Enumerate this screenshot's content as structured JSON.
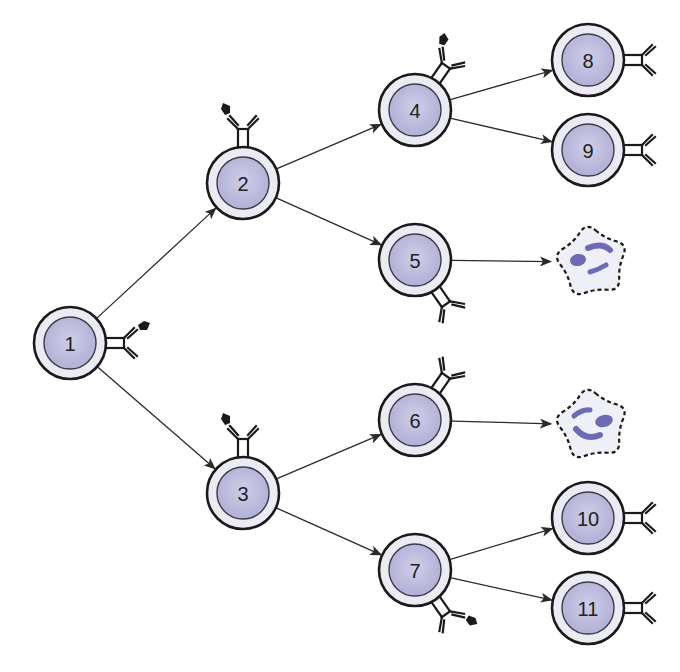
{
  "diagram": {
    "type": "B-cell clonal expansion / differentiation tree",
    "colors": {
      "background": "#ffffff",
      "cell_outline": "#1a1a1a",
      "cell_ring": "#ecebf4",
      "nucleus_fill": "#b8b7da",
      "nucleus_outline": "#3a3a4a",
      "plasma_cell_fill": "#efeff7",
      "plasma_cell_nuclear_fragments": "#6e6bb5",
      "arrow": "#2a2a2a",
      "antigen": "#1a1a1a"
    },
    "cells": [
      {
        "id": "1",
        "label": "1",
        "x": 70,
        "y": 343,
        "receptor_angle": 0,
        "antigen_bound": true
      },
      {
        "id": "2",
        "label": "2",
        "x": 243,
        "y": 183,
        "receptor_angle": -90,
        "antigen_bound": true
      },
      {
        "id": "3",
        "label": "3",
        "x": 243,
        "y": 493,
        "receptor_angle": -90,
        "antigen_bound": true
      },
      {
        "id": "4",
        "label": "4",
        "x": 415,
        "y": 110,
        "receptor_angle": -55,
        "antigen_bound": true
      },
      {
        "id": "5",
        "label": "5",
        "x": 415,
        "y": 260,
        "receptor_angle": 55,
        "antigen_bound": false
      },
      {
        "id": "6",
        "label": "6",
        "x": 415,
        "y": 420,
        "receptor_angle": -55,
        "antigen_bound": false
      },
      {
        "id": "7",
        "label": "7",
        "x": 415,
        "y": 570,
        "receptor_angle": 55,
        "antigen_bound": true
      },
      {
        "id": "8",
        "label": "8",
        "x": 588,
        "y": 60,
        "receptor_angle": 0,
        "antigen_bound": false
      },
      {
        "id": "9",
        "label": "9",
        "x": 588,
        "y": 150,
        "receptor_angle": 0,
        "antigen_bound": false
      },
      {
        "id": "10",
        "label": "10",
        "x": 588,
        "y": 518,
        "receptor_angle": 0,
        "antigen_bound": false
      },
      {
        "id": "11",
        "label": "11",
        "x": 588,
        "y": 608,
        "receptor_angle": 0,
        "antigen_bound": false
      }
    ],
    "plasma_cells": [
      {
        "id": "plasma-a",
        "x": 592,
        "y": 262,
        "from": "5"
      },
      {
        "id": "plasma-b",
        "x": 592,
        "y": 425,
        "from": "6"
      }
    ],
    "edges": [
      {
        "from": "1",
        "to": "2"
      },
      {
        "from": "1",
        "to": "3"
      },
      {
        "from": "2",
        "to": "4"
      },
      {
        "from": "2",
        "to": "5"
      },
      {
        "from": "3",
        "to": "6"
      },
      {
        "from": "3",
        "to": "7"
      },
      {
        "from": "4",
        "to": "8"
      },
      {
        "from": "4",
        "to": "9"
      },
      {
        "from": "5",
        "to": "plasma-a"
      },
      {
        "from": "6",
        "to": "plasma-b"
      },
      {
        "from": "7",
        "to": "10"
      },
      {
        "from": "7",
        "to": "11"
      }
    ]
  }
}
